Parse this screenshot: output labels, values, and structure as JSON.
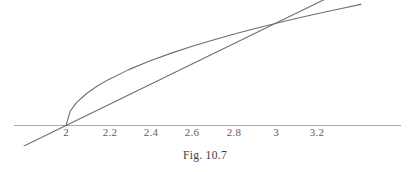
{
  "figure": {
    "caption": "Fig. 10.7",
    "axis_color": "#a8a8a8",
    "curve_color": "#6e6e6e",
    "line_color": "#6e6e6e",
    "label_color": "#5d5d5d",
    "background": "#ffffff"
  },
  "chart_data": {
    "type": "line",
    "title": "Fig. 10.7",
    "xlabel": "",
    "ylabel": "",
    "xlim": [
      1.77,
      3.41
    ],
    "ylim": [
      -0.28,
      1.42
    ],
    "grid": false,
    "legend": "none",
    "axis": {
      "x_axis_y_value": 0,
      "y_axis_shown": false,
      "ticks_shown_as_labels_only": true
    },
    "tick_labels": [
      "2",
      "2.2",
      "2.4",
      "2.6",
      "2.8",
      "3",
      "3.2"
    ],
    "tick_values": [
      2,
      2.2,
      2.4,
      2.6,
      2.8,
      3,
      3.2
    ],
    "series": [
      {
        "name": "curve",
        "equation": "y = sqrt(x - 2)",
        "x": [
          2,
          2.02,
          2.05,
          2.1,
          2.15,
          2.2,
          2.3,
          2.4,
          2.5,
          2.6,
          2.7,
          2.8,
          2.9,
          3,
          3.1,
          3.2,
          3.3,
          3.41
        ],
        "values": [
          0,
          0.1414,
          0.2236,
          0.3162,
          0.3873,
          0.4472,
          0.5477,
          0.6325,
          0.7071,
          0.7746,
          0.8367,
          0.8944,
          0.9487,
          1,
          1.0488,
          1.0954,
          1.1402,
          1.1874
        ]
      },
      {
        "name": "secant-line",
        "equation": "y = x - 2",
        "x": [
          1.77,
          3.41
        ],
        "values": [
          -0.23,
          1.41
        ]
      }
    ],
    "intersections": [
      {
        "x": 2,
        "y": 0
      },
      {
        "x": 3,
        "y": 1
      }
    ]
  },
  "tick_positions_px": [
    {
      "label": "2",
      "x": 66,
      "y": 127
    },
    {
      "label": "2.2",
      "x": 110,
      "y": 127
    },
    {
      "label": "2.4",
      "x": 151,
      "y": 127
    },
    {
      "label": "2.6",
      "x": 192,
      "y": 127
    },
    {
      "label": "2.8",
      "x": 234,
      "y": 127
    },
    {
      "label": "3",
      "x": 276,
      "y": 127
    },
    {
      "label": "3.2",
      "x": 317,
      "y": 127
    }
  ]
}
